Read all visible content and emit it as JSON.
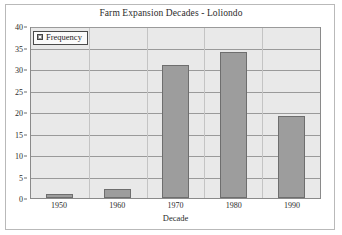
{
  "chart_data": {
    "type": "bar",
    "title": "Farm Expansion Decades - Loliondo",
    "xlabel": "Decade",
    "ylabel": "",
    "categories": [
      "1950",
      "1960",
      "1970",
      "1980",
      "1990"
    ],
    "values": [
      1,
      2,
      31,
      34,
      19
    ],
    "series": [
      {
        "name": "Frequency",
        "values": [
          1,
          2,
          31,
          34,
          19
        ]
      }
    ],
    "ylim": [
      0,
      40
    ],
    "ytick_step": 5,
    "yticks": [
      "0",
      "5",
      "10",
      "15",
      "20",
      "25",
      "30",
      "35",
      "40"
    ],
    "grid": "horizontal",
    "legend_position": "top-left",
    "legend_entries": [
      "Frequency"
    ]
  },
  "legend": {
    "label": "Frequency",
    "swatch_icon": "legend-square-icon"
  },
  "colors": {
    "bar_fill": "#9d9d9d",
    "bar_border": "#6e6e6e",
    "plot_background": "#e9e9e9",
    "gridline": "#9a9a9a",
    "plot_border": "#8a8a8a",
    "figure_frame": "#b9b9b9",
    "text": "#2b2b2b"
  }
}
